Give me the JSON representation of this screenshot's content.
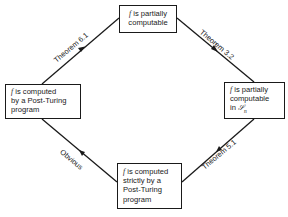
{
  "diagram": {
    "type": "equivalence-cycle",
    "nodes": [
      {
        "id": "top",
        "lines": [
          "is partially",
          "computable"
        ],
        "var": "f"
      },
      {
        "id": "left",
        "lines": [
          "is computed",
          "by a Post-Turing",
          "program"
        ],
        "var": "f"
      },
      {
        "id": "right",
        "lines": [
          "is partially",
          "computable",
          "in"
        ],
        "var": "f",
        "math": "𝒮",
        "math_sub": "n"
      },
      {
        "id": "bottom",
        "lines": [
          "is computed",
          "strictly by a",
          "Post-Turing",
          "program"
        ],
        "var": "f"
      }
    ],
    "edges": [
      {
        "from": "left",
        "to": "top",
        "label": "Theorem 6.1"
      },
      {
        "from": "top",
        "to": "right",
        "label": "Theorem 3.2"
      },
      {
        "from": "right",
        "to": "bottom",
        "label": "Theorem 5.1"
      },
      {
        "from": "bottom",
        "to": "left",
        "label": "Obvious"
      }
    ]
  }
}
